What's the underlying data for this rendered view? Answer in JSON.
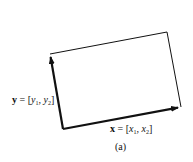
{
  "diagram": {
    "type": "parallelogram-vectors",
    "colors": {
      "background": "#ffffff",
      "stroke": "#111111"
    },
    "points": {
      "origin": [
        63,
        129
      ],
      "y_tip": [
        50,
        54
      ],
      "far_corner": [
        167,
        32
      ],
      "x_tip": [
        181,
        107
      ]
    },
    "vectors": [
      {
        "name": "y",
        "bold": "y",
        "equals": " = [",
        "comp1": "y",
        "sub1": "1",
        "sep": ", ",
        "comp2": "y",
        "sub2": "2",
        "close": "]"
      },
      {
        "name": "x",
        "bold": "x",
        "equals": " = [",
        "comp1": "x",
        "sub1": "1",
        "sep": ", ",
        "comp2": "x",
        "sub2": "2",
        "close": "]"
      }
    ],
    "caption": "(a)"
  }
}
